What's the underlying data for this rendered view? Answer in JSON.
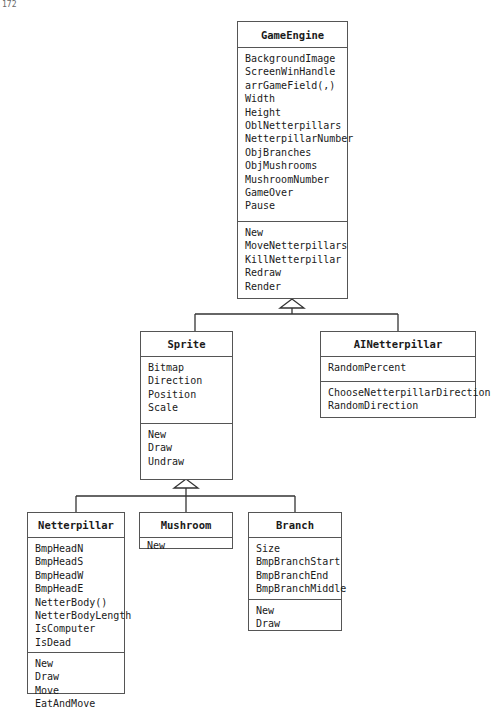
{
  "page_number": "172",
  "diagram": {
    "type": "UML class diagram",
    "classes": [
      {
        "name": "GameEngine",
        "attributes": [
          "BackgroundImage",
          "ScreenWinHandle",
          "arrGameField(,)",
          "Width",
          "Height",
          "OblNetterpillars",
          "NetterpillarNumber",
          "ObjBranches",
          "ObjMushrooms",
          "MushroomNumber",
          "GameOver",
          "Pause"
        ],
        "methods": [
          "New",
          "MoveNetterpillars",
          "KillNetterpillar",
          "Redraw",
          "Render"
        ]
      },
      {
        "name": "Sprite",
        "attributes": [
          "Bitmap",
          "Direction",
          "Position",
          "Scale"
        ],
        "methods": [
          "New",
          "Draw",
          "Undraw"
        ]
      },
      {
        "name": "AINetterpillar",
        "attributes": [
          "RandomPercent"
        ],
        "methods": [
          "ChooseNetterpillarDirection",
          "RandomDirection"
        ]
      },
      {
        "name": "Netterpillar",
        "attributes": [
          "BmpHeadN",
          "BmpHeadS",
          "BmpHeadW",
          "BmpHeadE",
          "NetterBody()",
          "NetterBodyLength",
          "IsComputer",
          "IsDead"
        ],
        "methods": [
          "New",
          "Draw",
          "Move",
          "EatAndMove"
        ]
      },
      {
        "name": "Mushroom",
        "attributes": [],
        "methods": [
          "New"
        ]
      },
      {
        "name": "Branch",
        "attributes": [
          "Size",
          "BmpBranchStart",
          "BmpBranchEnd",
          "BmpBranchMiddle"
        ],
        "methods": [
          "New",
          "Draw"
        ]
      }
    ],
    "relationships": [
      {
        "from": "Sprite",
        "to": "GameEngine",
        "type": "generalization"
      },
      {
        "from": "AINetterpillar",
        "to": "GameEngine",
        "type": "generalization"
      },
      {
        "from": "Netterpillar",
        "to": "Sprite",
        "type": "generalization"
      },
      {
        "from": "Mushroom",
        "to": "Sprite",
        "type": "generalization"
      },
      {
        "from": "Branch",
        "to": "Sprite",
        "type": "generalization"
      }
    ],
    "line_color": "#333333"
  }
}
